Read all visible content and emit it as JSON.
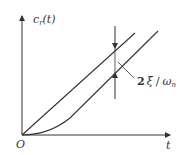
{
  "diagram": {
    "y_axis_label": "c",
    "y_axis_label_sub": "r",
    "y_axis_label_arg": "(t)",
    "x_axis_label": "t",
    "origin_label": "O",
    "annotation": {
      "coef": "2",
      "numerator": "ξ",
      "slash": "/",
      "denominator": "ω",
      "denominator_sub": "n"
    },
    "curves": [
      {
        "name": "ramp-input",
        "description": "straight line r(t)=t from origin"
      },
      {
        "name": "ramp-response",
        "description": "second-order system ramp response, curving from origin then parallel to input with lag 2ξ/ωn"
      }
    ],
    "line_color": "#333333"
  }
}
